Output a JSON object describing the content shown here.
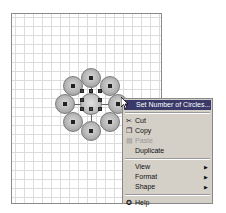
{
  "canvas": {
    "grid": "on",
    "shape_description": "cycle diagram with center circle and 8 surrounding circles (selected)"
  },
  "context_menu": {
    "items": [
      {
        "label": "Set Number of Circles...",
        "icon": "none",
        "highlighted": true
      },
      {
        "label": "Cut",
        "icon": "scissors-icon"
      },
      {
        "label": "Copy",
        "icon": "copy-icon"
      },
      {
        "label": "Paste",
        "icon": "paste-icon",
        "disabled": true
      },
      {
        "label": "Duplicate",
        "icon": "none"
      },
      {
        "label": "View",
        "submenu": true
      },
      {
        "label": "Format",
        "submenu": true
      },
      {
        "label": "Shape",
        "submenu": true
      },
      {
        "label": "Help",
        "icon": "help-icon"
      }
    ]
  },
  "colors": {
    "highlight": "#3a3a6a",
    "menu_bg": "#d4d0c8",
    "grid": "#dcdcdc"
  }
}
